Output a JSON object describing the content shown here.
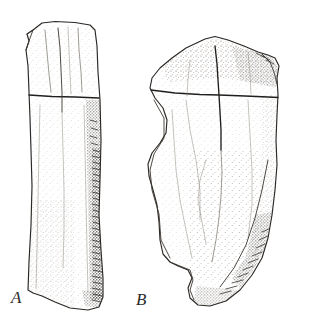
{
  "plate": {
    "background_color": "#ffffff",
    "ink_color": "#2a2724",
    "width": 315,
    "height": 329,
    "medium": "pen-and-ink stipple line drawing",
    "subject": "two lithic artifacts in plan view"
  },
  "figures": [
    {
      "id": "figure-a",
      "label": "A",
      "label_x": 11,
      "label_y": 289,
      "description": "elongated narrow blade-like artifact, vertical orientation, dense stippled retouch along right margin",
      "bounds": {
        "x": 25,
        "y": 21,
        "width": 78,
        "height": 290
      },
      "marks": {
        "transverse_line_y": 97,
        "medial_ridge_x": 61
      }
    },
    {
      "id": "figure-b",
      "label": "B",
      "label_x": 136,
      "label_y": 291,
      "description": "broad sub-triangular artifact with concave left margin and rounded basal tang, cruciform measurement cross near top",
      "bounds": {
        "x": 148,
        "y": 36,
        "width": 132,
        "height": 272
      },
      "marks": {
        "cross_center_x": 219,
        "cross_center_y": 95,
        "cross_horizontal_y": 95,
        "cross_vertical_x": 219
      }
    }
  ],
  "labels": {
    "a": "A",
    "b": "B"
  }
}
